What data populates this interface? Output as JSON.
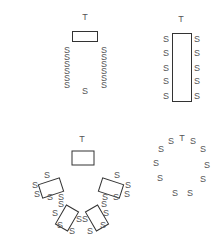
{
  "diagram": {
    "legend_symbols": {
      "teacher": "T",
      "student": "S"
    },
    "colors": {
      "text": "#555555",
      "outline": "#333333",
      "background": "#ffffff"
    },
    "layouts": [
      {
        "name": "rows",
        "teacher": {
          "label": "T",
          "x": 85,
          "y": 20
        },
        "tables": [
          {
            "x": 72,
            "y": 31,
            "w": 25,
            "h": 10,
            "rotate": 0
          }
        ],
        "students": [
          {
            "label": "S",
            "x": 67,
            "y": 53
          },
          {
            "label": "S",
            "x": 67,
            "y": 60
          },
          {
            "label": "S",
            "x": 67,
            "y": 67
          },
          {
            "label": "S",
            "x": 67,
            "y": 74
          },
          {
            "label": "S",
            "x": 67,
            "y": 81
          },
          {
            "label": "S",
            "x": 67,
            "y": 88
          },
          {
            "label": "S",
            "x": 104,
            "y": 53
          },
          {
            "label": "S",
            "x": 104,
            "y": 60
          },
          {
            "label": "S",
            "x": 104,
            "y": 67
          },
          {
            "label": "S",
            "x": 104,
            "y": 74
          },
          {
            "label": "S",
            "x": 104,
            "y": 81
          },
          {
            "label": "S",
            "x": 104,
            "y": 88
          },
          {
            "label": "S",
            "x": 85,
            "y": 94
          }
        ]
      },
      {
        "name": "long-table",
        "teacher": {
          "label": "T",
          "x": 181,
          "y": 22
        },
        "tables": [
          {
            "x": 172,
            "y": 33,
            "w": 19,
            "h": 68,
            "rotate": 0
          }
        ],
        "students": [
          {
            "label": "S",
            "x": 166,
            "y": 42
          },
          {
            "label": "S",
            "x": 166,
            "y": 56
          },
          {
            "label": "S",
            "x": 166,
            "y": 71
          },
          {
            "label": "S",
            "x": 166,
            "y": 84
          },
          {
            "label": "S",
            "x": 166,
            "y": 99
          },
          {
            "label": "S",
            "x": 197,
            "y": 42
          },
          {
            "label": "S",
            "x": 197,
            "y": 56
          },
          {
            "label": "S",
            "x": 197,
            "y": 71
          },
          {
            "label": "S",
            "x": 197,
            "y": 84
          },
          {
            "label": "S",
            "x": 197,
            "y": 99
          }
        ]
      },
      {
        "name": "group-tables-arc",
        "teacher": {
          "label": "T",
          "x": 82,
          "y": 142
        },
        "tables": [
          {
            "cx": 83,
            "cy": 158,
            "w": 22,
            "h": 14,
            "rotate": 0
          },
          {
            "cx": 51,
            "cy": 188,
            "w": 22,
            "h": 14,
            "rotate": -18
          },
          {
            "cx": 111,
            "cy": 188,
            "w": 22,
            "h": 14,
            "rotate": 18
          },
          {
            "cx": 67,
            "cy": 218,
            "w": 22,
            "h": 14,
            "rotate": -60
          },
          {
            "cx": 97,
            "cy": 218,
            "w": 22,
            "h": 14,
            "rotate": 60
          }
        ],
        "students": [
          {
            "label": "S",
            "x": 47,
            "y": 178
          },
          {
            "label": "S",
            "x": 35,
            "y": 188
          },
          {
            "label": "S",
            "x": 37,
            "y": 197
          },
          {
            "label": "S",
            "x": 50,
            "y": 200
          },
          {
            "label": "S",
            "x": 61,
            "y": 200
          },
          {
            "label": "S",
            "x": 61,
            "y": 207
          },
          {
            "label": "S",
            "x": 55,
            "y": 216
          },
          {
            "label": "S",
            "x": 60,
            "y": 228
          },
          {
            "label": "S",
            "x": 72,
            "y": 234
          },
          {
            "label": "S",
            "x": 79,
            "y": 222
          },
          {
            "label": "S",
            "x": 85,
            "y": 222
          },
          {
            "label": "S",
            "x": 90,
            "y": 234
          },
          {
            "label": "S",
            "x": 103,
            "y": 228
          },
          {
            "label": "S",
            "x": 106,
            "y": 216
          },
          {
            "label": "S",
            "x": 104,
            "y": 207
          },
          {
            "label": "S",
            "x": 105,
            "y": 200
          },
          {
            "label": "S",
            "x": 116,
            "y": 200
          },
          {
            "label": "S",
            "x": 117,
            "y": 178
          },
          {
            "label": "S",
            "x": 128,
            "y": 188
          },
          {
            "label": "S",
            "x": 127,
            "y": 197
          }
        ]
      },
      {
        "name": "circle",
        "teacher": {
          "label": "T",
          "x": 182,
          "y": 141
        },
        "tables": [],
        "students": [
          {
            "label": "S",
            "x": 171,
            "y": 144
          },
          {
            "label": "S",
            "x": 193,
            "y": 144
          },
          {
            "label": "S",
            "x": 161,
            "y": 152
          },
          {
            "label": "S",
            "x": 203,
            "y": 152
          },
          {
            "label": "S",
            "x": 156,
            "y": 166
          },
          {
            "label": "S",
            "x": 207,
            "y": 168
          },
          {
            "label": "S",
            "x": 160,
            "y": 181
          },
          {
            "label": "S",
            "x": 203,
            "y": 182
          },
          {
            "label": "S",
            "x": 175,
            "y": 196
          },
          {
            "label": "S",
            "x": 190,
            "y": 196
          }
        ]
      }
    ]
  }
}
